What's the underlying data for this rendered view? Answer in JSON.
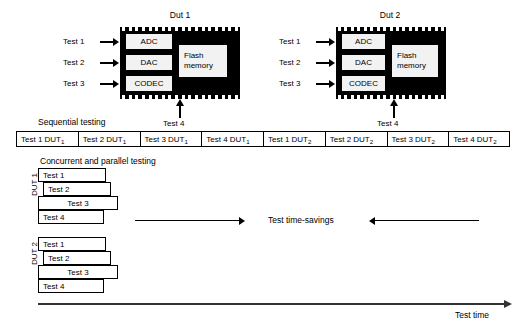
{
  "diagram": {
    "chips": [
      {
        "title": "Dut 1",
        "blocks": [
          "ADC",
          "DAC",
          "CODEC"
        ],
        "memory_line1": "Flash",
        "memory_line2": "memory",
        "test_labels": [
          "Test 1",
          "Test 2",
          "Test 3"
        ],
        "bottom_test_label": "Test 4"
      },
      {
        "title": "Dut 2",
        "blocks": [
          "ADC",
          "DAC",
          "CODEC"
        ],
        "memory_line1": "Flash",
        "memory_line2": "memory",
        "test_labels": [
          "Test 1",
          "Test 2",
          "Test 3"
        ],
        "bottom_test_label": "Test 4"
      }
    ],
    "sequential": {
      "caption": "Sequential testing",
      "cells": [
        {
          "test": "Test 1 DUT",
          "dut": "1"
        },
        {
          "test": "Test 2 DUT",
          "dut": "1"
        },
        {
          "test": "Test 3 DUT",
          "dut": "1"
        },
        {
          "test": "Test 4 DUT",
          "dut": "1"
        },
        {
          "test": "Test 1 DUT",
          "dut": "2"
        },
        {
          "test": "Test 2 DUT",
          "dut": "2"
        },
        {
          "test": "Test 3 DUT",
          "dut": "2"
        },
        {
          "test": "Test 4 DUT",
          "dut": "2"
        }
      ]
    },
    "concurrent": {
      "caption": "Concurrent and parallel testing",
      "groups": [
        {
          "label": "DUT 1",
          "bars": [
            {
              "label": "Test 1",
              "align": "l"
            },
            {
              "label": "Test 2",
              "align": "l"
            },
            {
              "label": "Test 3",
              "align": "c"
            },
            {
              "label": "Test 4",
              "align": "l"
            }
          ]
        },
        {
          "label": "DUT 2",
          "bars": [
            {
              "label": "Test 1",
              "align": "l"
            },
            {
              "label": "Test 2",
              "align": "l"
            },
            {
              "label": "Test 3",
              "align": "c"
            },
            {
              "label": "Test 4",
              "align": "l"
            }
          ]
        }
      ]
    },
    "savings_label": "Test time-savings",
    "axis_label": "Test time"
  }
}
